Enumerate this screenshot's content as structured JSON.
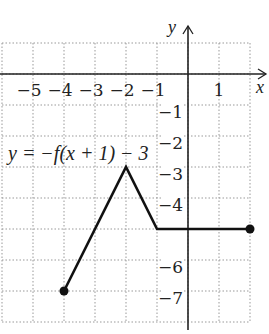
{
  "chart_data": {
    "type": "line",
    "title": "",
    "annotation": "y = −f(x + 1) − 3",
    "xlabel": "x",
    "ylabel": "y",
    "xlim": [
      -6,
      2
    ],
    "ylim": [
      -8,
      1
    ],
    "grid": true,
    "x_tick_labels": [
      "−5",
      "−4",
      "−3",
      "−2",
      "−1",
      "1"
    ],
    "x_ticks": [
      -5,
      -4,
      -3,
      -2,
      -1,
      1
    ],
    "y_tick_labels": [
      "−1",
      "−2",
      "−3",
      "−4",
      "−6",
      "−7"
    ],
    "y_ticks": [
      -1,
      -2,
      -3,
      -4,
      -6,
      -7
    ],
    "series": [
      {
        "name": "y = −f(x + 1) − 3",
        "x": [
          -4,
          -2,
          -1,
          2
        ],
        "y": [
          -7,
          -3,
          -5,
          -5
        ],
        "endpoints": [
          [
            -4,
            -7
          ],
          [
            2,
            -5
          ]
        ]
      }
    ]
  },
  "labels": {
    "equation": "y = −f(x + 1) − 3",
    "x_axis": "x",
    "y_axis": "y"
  }
}
